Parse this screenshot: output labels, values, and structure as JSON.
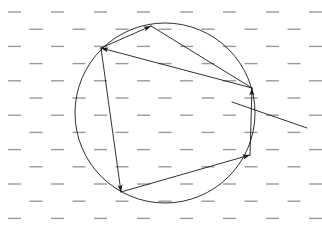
{
  "figure": {
    "canvas": {
      "width": 322,
      "height": 231,
      "background": "#ffffff"
    },
    "stroke_color": "#1a1a1a",
    "hatch_color": "#9a9a9a",
    "stroke_width": 0.9
  },
  "background_field": {
    "name": "dashed-hatch-field",
    "dash_color": "#9a9a9a",
    "dash_length": 13,
    "dash_thickness": 1.4,
    "row_spacing": 17.2,
    "column_spacing": 43,
    "row_offset_stagger": 21.5,
    "first_row_y": 12,
    "first_col_x": 8,
    "rows": 13,
    "columns": 8
  },
  "circle": {
    "name": "main-circle",
    "center_x": 165,
    "center_y": 113,
    "radius": 90,
    "fill": "none"
  },
  "vertices": [
    {
      "id": "A",
      "label": "top-vertex",
      "x": 151,
      "y": 26
    },
    {
      "id": "B",
      "label": "upper-left-vertex",
      "x": 101,
      "y": 48
    },
    {
      "id": "C",
      "label": "lower-left-vertex",
      "x": 121,
      "y": 192
    },
    {
      "id": "D",
      "label": "lower-right-vertex",
      "x": 250,
      "y": 155
    },
    {
      "id": "E",
      "label": "upper-right-vertex",
      "x": 252,
      "y": 88
    }
  ],
  "chords": [
    {
      "name": "chord-b-to-a",
      "from": "B",
      "to": "A",
      "arrow_at": "to",
      "x1": 101,
      "y1": 48,
      "x2": 151,
      "y2": 26
    },
    {
      "name": "chord-a-to-e",
      "from": "A",
      "to": "E",
      "arrow_at": "none",
      "x1": 151,
      "y1": 26,
      "x2": 252,
      "y2": 88
    },
    {
      "name": "chord-e-to-b",
      "from": "E",
      "to": "B",
      "arrow_at": "to",
      "x1": 252,
      "y1": 88,
      "x2": 101,
      "y2": 48
    },
    {
      "name": "chord-b-to-c",
      "from": "B",
      "to": "C",
      "arrow_at": "to",
      "x1": 101,
      "y1": 48,
      "x2": 121,
      "y2": 192
    },
    {
      "name": "chord-c-to-d",
      "from": "C",
      "to": "D",
      "arrow_at": "to",
      "x1": 121,
      "y1": 192,
      "x2": 250,
      "y2": 155
    },
    {
      "name": "chord-d-to-e",
      "from": "D",
      "to": "E",
      "arrow_at": "to",
      "x1": 250,
      "y1": 155,
      "x2": 252,
      "y2": 88
    }
  ],
  "secant_line": {
    "name": "secant-line",
    "x1": 232,
    "y1": 102,
    "x2": 307,
    "y2": 128,
    "arrow_at": "none"
  },
  "arrowheads": [
    {
      "name": "arrowhead-at-top-vertex",
      "x": 151,
      "y": 26,
      "points_to": "A"
    },
    {
      "name": "arrowhead-at-upper-left-vertex",
      "x": 101,
      "y": 48,
      "points_to": "B"
    },
    {
      "name": "arrowhead-at-lower-left-vertex",
      "x": 121,
      "y": 192,
      "points_to": "C"
    },
    {
      "name": "arrowhead-at-lower-right-vertex",
      "x": 250,
      "y": 155,
      "points_to": "D"
    },
    {
      "name": "arrowhead-at-upper-right-vertex",
      "x": 252,
      "y": 88,
      "points_to": "E"
    }
  ]
}
